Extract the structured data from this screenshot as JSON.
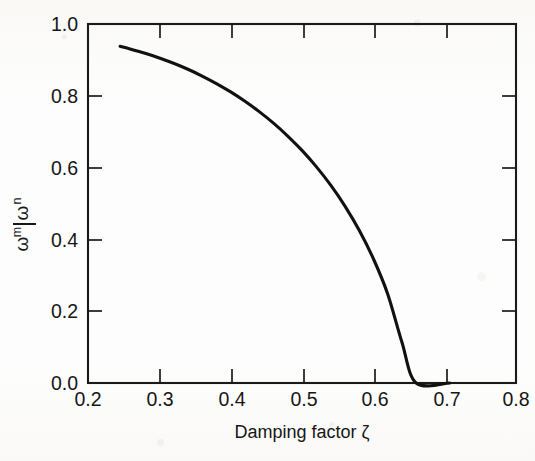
{
  "figure": {
    "background_color": "#fdfdfc",
    "ink_color": "#111111"
  },
  "chart_data": {
    "type": "line",
    "title": "",
    "subtitle": "",
    "xlabel": "Damping factor ζ",
    "ylabel": "ωm/ωn",
    "ylabel_numerator": "ω",
    "ylabel_numerator_sub": "m",
    "ylabel_denominator": "ω",
    "ylabel_denominator_sub": "n",
    "xlim": [
      0.2,
      0.8
    ],
    "ylim": [
      0.0,
      1.0
    ],
    "xticks": [
      0.2,
      0.3,
      0.4,
      0.5,
      0.6,
      0.7,
      0.8
    ],
    "xticklabels": [
      "0.2",
      "0.3",
      "0.4",
      "0.5",
      "0.6",
      "0.7",
      "0.8"
    ],
    "yticks": [
      0.0,
      0.2,
      0.4,
      0.6,
      0.8,
      1.0
    ],
    "yticklabels": [
      "0.0",
      "0.2",
      "0.4",
      "0.6",
      "0.8",
      "1.0"
    ],
    "grid": false,
    "legend": null,
    "legend_position": "none",
    "annotations": [],
    "series": [
      {
        "name": "ωm/ωn = sqrt(1 - 2ζ^2)",
        "color": "#111111",
        "linewidth": 3.1,
        "x": [
          0.245,
          0.26,
          0.28,
          0.3,
          0.32,
          0.34,
          0.36,
          0.38,
          0.4,
          0.42,
          0.44,
          0.46,
          0.48,
          0.5,
          0.52,
          0.54,
          0.56,
          0.58,
          0.6,
          0.62,
          0.64,
          0.66,
          0.67,
          0.68,
          0.69,
          0.695,
          0.7,
          0.703,
          0.705,
          0.7071
        ],
        "y": [
          0.9378,
          0.9299,
          0.9185,
          0.9055,
          0.8906,
          0.8739,
          0.8551,
          0.8341,
          0.8108,
          0.7848,
          0.7559,
          0.7238,
          0.6879,
          0.6479,
          0.6027,
          0.5517,
          0.4935,
          0.4261,
          0.3464,
          0.2487,
          0.1142,
          0.0,
          0.0,
          0.0,
          0.0,
          0.0,
          0.0,
          0.0,
          0.0,
          0.0
        ]
      }
    ],
    "curve_endpoints": {
      "start": {
        "x": 0.245,
        "y": 0.938
      },
      "end": {
        "x": 0.7071,
        "y": 0.0
      }
    }
  }
}
